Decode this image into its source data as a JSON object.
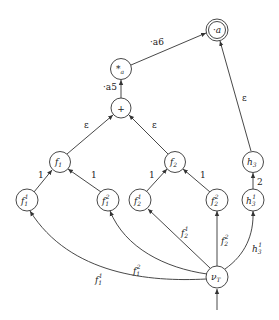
{
  "diagram": {
    "nodes": {
      "final": {
        "label": "·a",
        "shape": "double-circle"
      },
      "star": {
        "label": "*",
        "sub": "a"
      },
      "plus": {
        "label": "+"
      },
      "f1": {
        "label": "f",
        "sub": "1"
      },
      "f2": {
        "label": "f",
        "sub": "2"
      },
      "h3": {
        "label": "h",
        "sub": "3"
      },
      "f1_1": {
        "label": "f",
        "sub": "1",
        "sup": "1"
      },
      "f1_2": {
        "label": "f",
        "sub": "1",
        "sup": "2"
      },
      "f2_1": {
        "label": "f",
        "sub": "2",
        "sup": "1"
      },
      "f2_2": {
        "label": "f",
        "sub": "2",
        "sup": "2"
      },
      "h3_1": {
        "label": "h",
        "sub": "3",
        "sup": "1"
      },
      "nuT": {
        "label": "ν",
        "sub": "T"
      }
    },
    "edges": {
      "star_final": "·a6",
      "plus_star": "·a5",
      "f1_plus": "ε",
      "f2_plus": "ε",
      "h3_final": "ε",
      "f1_1_f1": "1",
      "f1_2_f1": "1",
      "f2_1_f2": "1",
      "f2_2_f2": "1",
      "h3_1_h3": "2",
      "nuT_f1_1": {
        "label": "f",
        "sub": "1",
        "sup": "1"
      },
      "nuT_f1_2": {
        "label": "f",
        "sub": "1",
        "sup": "2"
      },
      "nuT_f2_1": {
        "label": "f",
        "sub": "2",
        "sup": "1"
      },
      "nuT_f2_2": {
        "label": "f",
        "sub": "2",
        "sup": "2"
      },
      "nuT_h3_1": {
        "label": "h",
        "sub": "3",
        "sup": "1"
      }
    }
  }
}
